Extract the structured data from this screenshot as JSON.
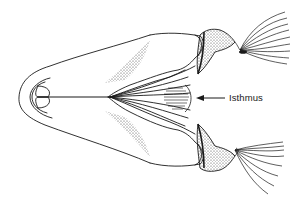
{
  "figure": {
    "style": "black line drawing with stipple shading",
    "colors": {
      "ink": "#1a1a1a",
      "background": "#ffffff"
    },
    "annotations": [
      {
        "label": "Isthmus",
        "pointer": "arrow pointing left to hatched isthmus region"
      }
    ]
  }
}
